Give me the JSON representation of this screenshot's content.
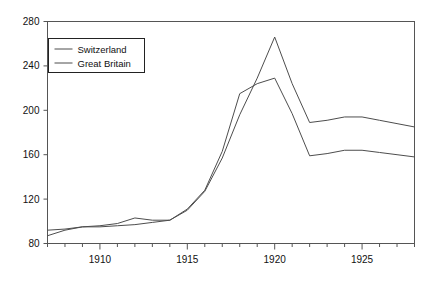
{
  "chart_data": {
    "type": "line",
    "title": "",
    "subtitle": "",
    "xlabel": "",
    "ylabel": "",
    "xlim": [
      1907,
      1928
    ],
    "ylim": [
      80,
      280
    ],
    "yticks": [
      80,
      120,
      160,
      200,
      240,
      280
    ],
    "ytick_labels": [
      "80",
      "120",
      "160",
      "200",
      "240",
      "280"
    ],
    "xticks": [
      1910,
      1915,
      1920,
      1925
    ],
    "xtick_labels": [
      "1910",
      "1915",
      "1920",
      "1925"
    ],
    "xtick_minor_every": 1,
    "grid": false,
    "legend_position": "upper left",
    "x": [
      1907,
      1908,
      1909,
      1910,
      1911,
      1912,
      1913,
      1914,
      1915,
      1916,
      1917,
      1918,
      1919,
      1920,
      1921,
      1922,
      1923,
      1924,
      1925,
      1926,
      1927,
      1928
    ],
    "series": [
      {
        "name": "Switzerland",
        "color": "#4d4d4d",
        "values": [
          92,
          93,
          95,
          95,
          96,
          97,
          99,
          101,
          110,
          127,
          157,
          196,
          229,
          266,
          224,
          189,
          191,
          194,
          194,
          191,
          188,
          185
        ]
      },
      {
        "name": "Great Britain",
        "color": "#4d4d4d",
        "values": [
          87,
          92,
          95,
          96,
          98,
          103,
          101,
          101,
          111,
          128,
          163,
          215,
          224,
          229,
          197,
          159,
          161,
          164,
          164,
          162,
          160,
          158
        ]
      }
    ]
  },
  "legend": {
    "items": [
      {
        "label": "Switzerland"
      },
      {
        "label": "Great Britain"
      }
    ]
  },
  "colors": {
    "axis": "#555555",
    "text": "#111111",
    "line": "#4d4d4d",
    "background": "#ffffff"
  }
}
